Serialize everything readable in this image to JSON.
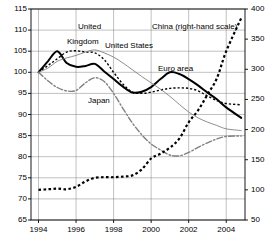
{
  "chart_data": {
    "type": "line",
    "title": "",
    "subtitle": "",
    "xlabel": "",
    "ylabel": "",
    "grid": true,
    "legend_position": "inline-annotations",
    "x": [
      1994,
      1994.5,
      1995,
      1995.5,
      1996,
      1996.5,
      1997,
      1997.5,
      1998,
      1998.5,
      1999,
      1999.5,
      2000,
      2000.5,
      2001,
      2001.5,
      2002,
      2002.5,
      2003,
      2003.5,
      2004,
      2004.8
    ],
    "x_tick_labels": [
      "1994",
      "1996",
      "1998",
      "2000",
      "2002",
      "2004"
    ],
    "x_ticks": [
      1994,
      1996,
      1998,
      2000,
      2002,
      2004
    ],
    "xlim": [
      1993.6,
      2005.0
    ],
    "left_axis": {
      "ylim": [
        65,
        115
      ],
      "ticks": [
        65,
        70,
        75,
        80,
        85,
        90,
        95,
        100,
        105,
        110,
        115
      ],
      "tick_labels": [
        "65",
        "70",
        "75",
        "80",
        "85",
        "90",
        "95",
        "100",
        "105",
        "110",
        "115"
      ]
    },
    "right_axis": {
      "ylim": [
        50,
        400
      ],
      "ticks": [
        50,
        100,
        150,
        200,
        250,
        300,
        350,
        400
      ],
      "tick_labels": [
        "50",
        "100",
        "150",
        "200",
        "250",
        "300",
        "350",
        "400"
      ],
      "note": "right-hand scale used by China series"
    },
    "series": [
      {
        "name": "Euro area",
        "label": "Euro area",
        "axis": "left",
        "style": "solid-thick",
        "color": "#000000",
        "width": 2.0,
        "values": [
          100.0,
          102.6,
          105.0,
          102.2,
          101.3,
          101.5,
          102.0,
          100.2,
          98.4,
          96.6,
          95.2,
          95.4,
          96.5,
          98.4,
          100.0,
          99.6,
          98.4,
          96.9,
          95.2,
          93.6,
          91.7,
          89.2
        ]
      },
      {
        "name": "United Kingdom",
        "label": "United Kingdom",
        "label_line1": "United",
        "label_line2": "Kingdom",
        "axis": "left",
        "style": "dotted-square",
        "color": "#000000",
        "width": 1.4,
        "values": [
          100.0,
          101.6,
          103.2,
          104.8,
          105.1,
          104.8,
          104.6,
          103.0,
          100.0,
          97.2,
          95.3,
          95.0,
          95.3,
          95.8,
          96.2,
          96.3,
          96.2,
          95.6,
          94.4,
          93.3,
          92.6,
          92.3
        ]
      },
      {
        "name": "United States",
        "label": "United States",
        "axis": "left",
        "style": "solid-thin",
        "color": "#808080",
        "width": 0.9,
        "values": [
          100.0,
          101.0,
          102.6,
          103.4,
          104.0,
          104.8,
          105.3,
          104.6,
          103.6,
          102.2,
          100.6,
          99.0,
          97.5,
          96.0,
          94.3,
          92.4,
          90.6,
          89.2,
          88.2,
          87.4,
          86.6,
          86.2
        ]
      },
      {
        "name": "Japan",
        "label": "Japan",
        "axis": "left",
        "style": "dash-dot",
        "color": "#808080",
        "width": 1.4,
        "values": [
          100.0,
          98.0,
          96.4,
          95.6,
          95.7,
          97.5,
          98.7,
          97.8,
          95.0,
          91.4,
          88.0,
          85.2,
          83.0,
          81.6,
          80.4,
          80.2,
          81.0,
          82.2,
          83.3,
          84.2,
          84.8,
          84.9
        ]
      },
      {
        "name": "China (right-hand scale)",
        "label": "China (right-hand scale)",
        "axis": "right",
        "style": "dotted-heavy",
        "color": "#000000",
        "width": 2.2,
        "values": [
          100,
          101,
          102,
          101,
          105,
          114,
          120,
          121,
          121,
          122,
          124,
          134,
          152,
          160,
          170,
          185,
          212,
          232,
          258,
          285,
          330,
          385
        ]
      }
    ],
    "annotations": [
      {
        "text": "United",
        "x_px": 78,
        "y_px": 22
      },
      {
        "text": "Kingdom",
        "x_px": 67,
        "y_px": 37
      },
      {
        "text": "United States",
        "x_px": 105,
        "y_px": 41
      },
      {
        "text": "Euro area",
        "x_px": 158,
        "y_px": 64
      },
      {
        "text": "Japan",
        "x_px": 88,
        "y_px": 96
      },
      {
        "text": "China (right-hand scale)",
        "x_px": 152,
        "y_px": 22
      }
    ]
  },
  "axes": {
    "left_labels": [
      "115",
      "110",
      "105",
      "100",
      "95",
      "90",
      "85",
      "80",
      "75",
      "70",
      "65"
    ],
    "right_labels": [
      "400",
      "350",
      "300",
      "250",
      "200",
      "150",
      "100",
      "50"
    ],
    "x_labels": [
      "1994",
      "1996",
      "1998",
      "2000",
      "2002",
      "2004"
    ]
  },
  "colors": {
    "background": "#ffffff",
    "axis": "#000000",
    "grid": "#808080",
    "series_dark": "#000000",
    "series_gray": "#808080"
  }
}
